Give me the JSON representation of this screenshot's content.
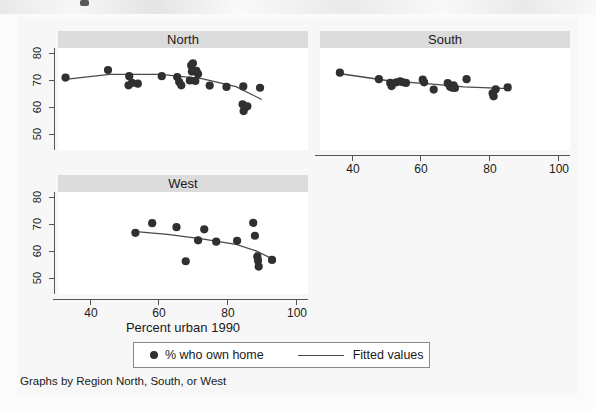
{
  "figure": {
    "width": 596,
    "height": 409,
    "background": "#f7f7f7",
    "panel_title_bg": "#dcdcdc",
    "marker_color": "#303030",
    "line_color": "#4a4a4a",
    "axis_color": "#555555"
  },
  "xaxis_title": "Percent urban 1990",
  "note": "Graphs by Region North, South, or West",
  "legend": {
    "marker_entry_label": "% who own home",
    "line_entry_label": "Fitted values"
  },
  "chart_data": {
    "type": "scatter",
    "title": "",
    "subtitle": "",
    "xlabel": "Percent urban 1990",
    "ylabel": "",
    "note": "Graphs by Region North, South, or West",
    "xlim": [
      30,
      103
    ],
    "ylim": [
      46,
      84
    ],
    "xticks": [
      40,
      60,
      80,
      100
    ],
    "yticks": [
      50,
      60,
      70,
      80
    ],
    "grid": false,
    "legend_position": "bottom",
    "legend_entries": [
      "% who own home",
      "Fitted values"
    ],
    "facet_by": "Region",
    "facets": [
      {
        "name": "North",
        "points": [
          {
            "x": 32.2,
            "y": 73.0
          },
          {
            "x": 44.6,
            "y": 75.8
          },
          {
            "x": 50.8,
            "y": 73.5
          },
          {
            "x": 50.6,
            "y": 70.1
          },
          {
            "x": 51.6,
            "y": 71.0
          },
          {
            "x": 53.3,
            "y": 70.7
          },
          {
            "x": 60.3,
            "y": 73.5
          },
          {
            "x": 64.8,
            "y": 73.2
          },
          {
            "x": 65.4,
            "y": 71.3
          },
          {
            "x": 66.0,
            "y": 70.1
          },
          {
            "x": 68.9,
            "y": 77.5
          },
          {
            "x": 69.4,
            "y": 78.3
          },
          {
            "x": 69.1,
            "y": 75.2
          },
          {
            "x": 68.5,
            "y": 71.9
          },
          {
            "x": 70.4,
            "y": 75.5
          },
          {
            "x": 70.9,
            "y": 74.3
          },
          {
            "x": 70.1,
            "y": 71.7
          },
          {
            "x": 74.3,
            "y": 70.0
          },
          {
            "x": 79.2,
            "y": 69.5
          },
          {
            "x": 83.9,
            "y": 63.0
          },
          {
            "x": 84.6,
            "y": 61.8
          },
          {
            "x": 84.2,
            "y": 60.5
          },
          {
            "x": 85.3,
            "y": 62.3
          },
          {
            "x": 84.1,
            "y": 69.7
          },
          {
            "x": 89.0,
            "y": 69.2
          }
        ],
        "fit_line": [
          {
            "x": 31.5,
            "y": 72.2
          },
          {
            "x": 45.0,
            "y": 74.2
          },
          {
            "x": 60.0,
            "y": 74.2
          },
          {
            "x": 72.0,
            "y": 72.6
          },
          {
            "x": 82.0,
            "y": 69.6
          },
          {
            "x": 89.5,
            "y": 64.8
          }
        ],
        "show_yaxis": true,
        "show_xaxis": false
      },
      {
        "name": "South",
        "points": [
          {
            "x": 35.8,
            "y": 74.8
          },
          {
            "x": 47.2,
            "y": 72.4
          },
          {
            "x": 50.5,
            "y": 71.0
          },
          {
            "x": 50.9,
            "y": 69.8
          },
          {
            "x": 52.3,
            "y": 71.2
          },
          {
            "x": 53.4,
            "y": 71.6
          },
          {
            "x": 54.0,
            "y": 71.3
          },
          {
            "x": 55.1,
            "y": 71.0
          },
          {
            "x": 60.0,
            "y": 72.2
          },
          {
            "x": 60.4,
            "y": 71.2
          },
          {
            "x": 63.2,
            "y": 68.5
          },
          {
            "x": 67.3,
            "y": 70.9
          },
          {
            "x": 68.0,
            "y": 69.6
          },
          {
            "x": 68.6,
            "y": 69.2
          },
          {
            "x": 69.4,
            "y": 69.1
          },
          {
            "x": 69.0,
            "y": 70.1
          },
          {
            "x": 72.8,
            "y": 72.4
          },
          {
            "x": 80.4,
            "y": 67.1
          },
          {
            "x": 80.7,
            "y": 66.0
          },
          {
            "x": 81.3,
            "y": 68.6
          },
          {
            "x": 84.8,
            "y": 69.3
          }
        ],
        "fit_line": [
          {
            "x": 35.5,
            "y": 74.5
          },
          {
            "x": 50.0,
            "y": 71.8
          },
          {
            "x": 62.0,
            "y": 70.6
          },
          {
            "x": 72.0,
            "y": 69.5
          },
          {
            "x": 85.0,
            "y": 68.9
          }
        ],
        "show_yaxis": false,
        "show_xaxis": true
      },
      {
        "name": "West",
        "points": [
          {
            "x": 52.6,
            "y": 68.8
          },
          {
            "x": 57.5,
            "y": 72.4
          },
          {
            "x": 64.6,
            "y": 70.9
          },
          {
            "x": 67.3,
            "y": 58.2
          },
          {
            "x": 70.9,
            "y": 66.0
          },
          {
            "x": 72.7,
            "y": 70.1
          },
          {
            "x": 76.2,
            "y": 65.5
          },
          {
            "x": 82.3,
            "y": 65.8
          },
          {
            "x": 87.0,
            "y": 72.5
          },
          {
            "x": 87.5,
            "y": 67.7
          },
          {
            "x": 88.2,
            "y": 60.0
          },
          {
            "x": 88.4,
            "y": 58.5
          },
          {
            "x": 88.6,
            "y": 56.2
          },
          {
            "x": 92.5,
            "y": 58.7
          }
        ],
        "fit_line": [
          {
            "x": 52.0,
            "y": 69.3
          },
          {
            "x": 62.0,
            "y": 68.2
          },
          {
            "x": 72.0,
            "y": 66.5
          },
          {
            "x": 82.0,
            "y": 64.5
          },
          {
            "x": 88.0,
            "y": 62.0
          },
          {
            "x": 93.0,
            "y": 58.8
          }
        ],
        "show_yaxis": true,
        "show_xaxis": true
      }
    ]
  }
}
